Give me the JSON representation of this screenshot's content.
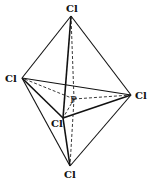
{
  "figure": {
    "central_atom": "P",
    "ligand_label": "Cl",
    "atoms": {
      "top": {
        "label": "Cl",
        "x": 71,
        "y": 16
      },
      "left": {
        "label": "Cl",
        "x": 22,
        "y": 78
      },
      "right": {
        "label": "Cl",
        "x": 131,
        "y": 95
      },
      "front": {
        "label": "Cl",
        "x": 63,
        "y": 118
      },
      "bottom": {
        "label": "Cl",
        "x": 70,
        "y": 166
      },
      "center": {
        "label": "P",
        "x": 74,
        "y": 99
      }
    }
  }
}
